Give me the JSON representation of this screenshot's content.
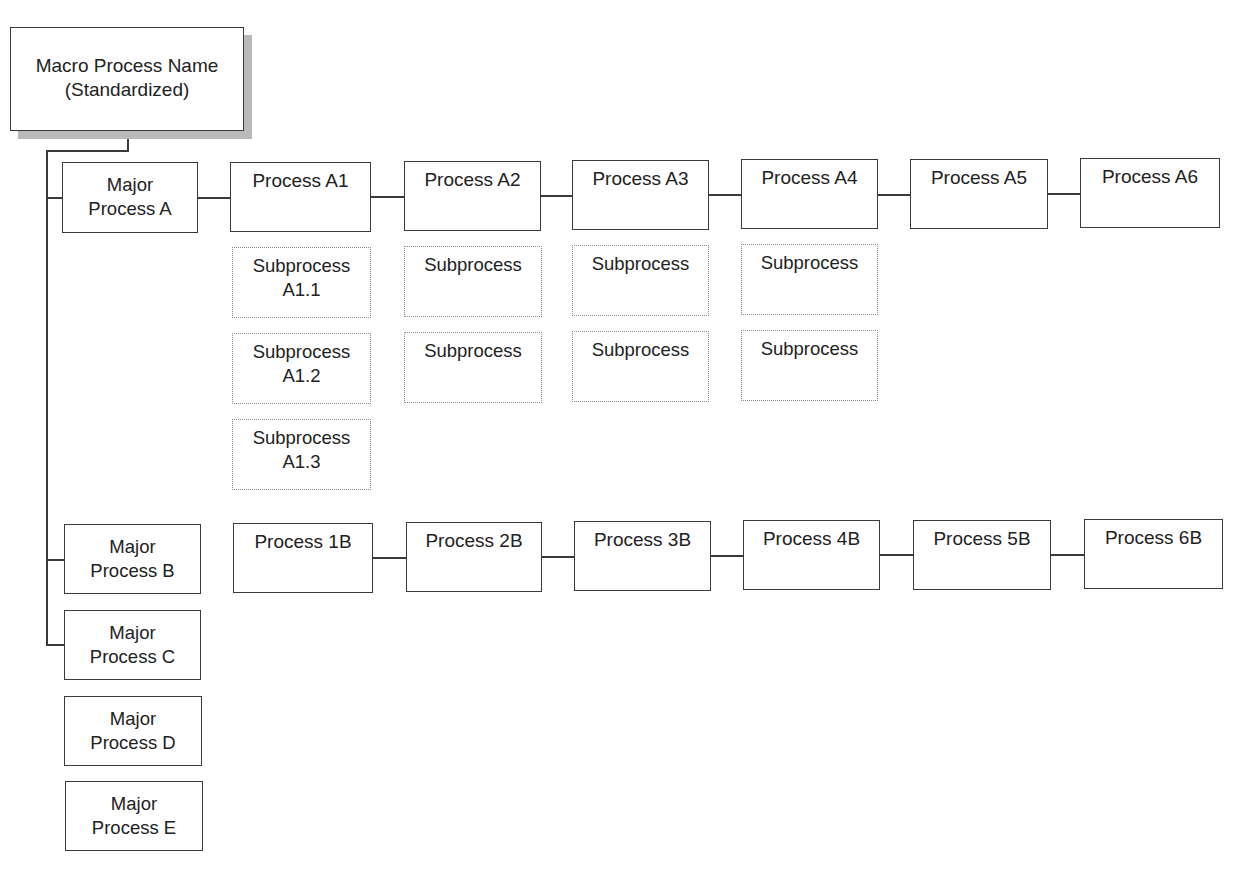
{
  "macro": {
    "line1": "Macro Process Name",
    "line2": "(Standardized)"
  },
  "major_processes": [
    {
      "line1": "Major",
      "line2": "Process A",
      "connected": true
    },
    {
      "line1": "Major",
      "line2": "Process B",
      "connected": true
    },
    {
      "line1": "Major",
      "line2": "Process C",
      "connected": true
    },
    {
      "line1": "Major",
      "line2": "Process D",
      "connected": false
    },
    {
      "line1": "Major",
      "line2": "Process E",
      "connected": false
    }
  ],
  "row_a": {
    "processes": [
      "Process A1",
      "Process A2",
      "Process A3",
      "Process A4",
      "Process A5",
      "Process A6"
    ],
    "subprocesses": {
      "a1": [
        {
          "line1": "Subprocess",
          "line2": "A1.1"
        },
        {
          "line1": "Subprocess",
          "line2": "A1.2"
        },
        {
          "line1": "Subprocess",
          "line2": "A1.3"
        }
      ],
      "a2": [
        {
          "line1": "Subprocess",
          "line2": ""
        },
        {
          "line1": "Subprocess",
          "line2": ""
        }
      ],
      "a3": [
        {
          "line1": "Subprocess",
          "line2": ""
        },
        {
          "line1": "Subprocess",
          "line2": ""
        }
      ],
      "a4": [
        {
          "line1": "Subprocess",
          "line2": ""
        },
        {
          "line1": "Subprocess",
          "line2": ""
        }
      ]
    }
  },
  "row_b": {
    "processes": [
      "Process 1B",
      "Process 2B",
      "Process 3B",
      "Process 4B",
      "Process 5B",
      "Process 6B"
    ]
  },
  "colors": {
    "border": "#3a3a3a",
    "dotted_border": "#8a8a8a",
    "shadow": "#b9b9b9",
    "background": "#ffffff"
  }
}
